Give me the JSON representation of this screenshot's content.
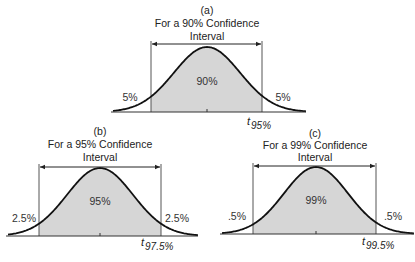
{
  "colors": {
    "fill": "#d6d6d6",
    "curve": "#111111",
    "line": "#555555",
    "text": "#222222"
  },
  "panels": [
    {
      "id": "a",
      "label": "(a)",
      "title_line1": "For a 90% Confidence",
      "title_line2": "Interval",
      "center_label": "90%",
      "left_tail_label": "5%",
      "right_tail_label": "5%",
      "t_symbol": "t",
      "t_subscript": "95%",
      "confidence": 90
    },
    {
      "id": "b",
      "label": "(b)",
      "title_line1": "For a 95% Confidence",
      "title_line2": "Interval",
      "center_label": "95%",
      "left_tail_label": "2.5%",
      "right_tail_label": "2.5%",
      "t_symbol": "t",
      "t_subscript": "97.5%",
      "confidence": 95
    },
    {
      "id": "c",
      "label": "(c)",
      "title_line1": "For a 99% Confidence",
      "title_line2": "Interval",
      "center_label": "99%",
      "left_tail_label": ".5%",
      "right_tail_label": ".5%",
      "t_symbol": "t",
      "t_subscript": "99.5%",
      "confidence": 99
    }
  ]
}
